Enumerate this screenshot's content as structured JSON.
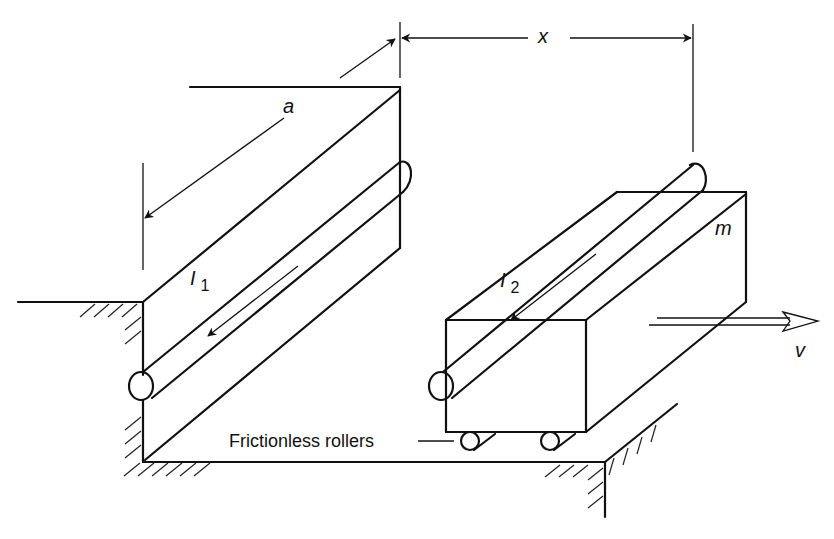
{
  "diagram": {
    "labels": {
      "a": "a",
      "x": "x",
      "m": "m",
      "v": "v",
      "I1_main": "I",
      "I1_sub": "1",
      "I2_main": "I",
      "I2_sub": "2",
      "rollers": "Frictionless rollers"
    },
    "elements": [
      {
        "id": "fixed-rod",
        "label": "I1",
        "current_direction": "toward viewer (down-left)"
      },
      {
        "id": "moving-rod",
        "label": "I2",
        "current_direction": "toward viewer (down-left)"
      },
      {
        "id": "block",
        "label": "m",
        "velocity": "v",
        "velocity_direction": "right"
      },
      {
        "id": "dimension-a",
        "label": "a",
        "meaning": "rod length"
      },
      {
        "id": "dimension-x",
        "label": "x",
        "meaning": "separation between rods"
      }
    ],
    "colors": {
      "line": "#111111",
      "background": "#ffffff"
    }
  }
}
